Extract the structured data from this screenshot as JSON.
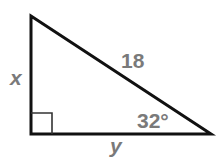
{
  "diagram": {
    "type": "right-triangle",
    "vertices": {
      "top": [
        31,
        16
      ],
      "right_angle": [
        31,
        134
      ],
      "acute_right": [
        211,
        134
      ]
    },
    "stroke_color": "#111111",
    "label_color": "#7a7a7a",
    "labels": {
      "hypotenuse": "18",
      "vertical_leg": "x",
      "horizontal_leg": "y",
      "angle": "32°"
    },
    "right_angle_marker": true
  }
}
